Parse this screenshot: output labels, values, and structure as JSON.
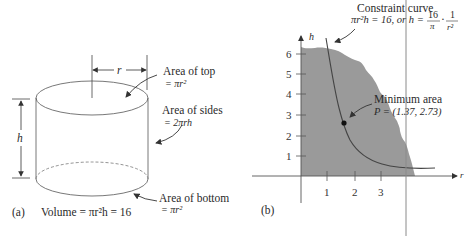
{
  "panel_a": {
    "caption_tag": "(a)",
    "caption_text": "Volume = πr²h = 16",
    "dimension_r": "r",
    "dimension_h": "h",
    "label_top_line1": "Area of top",
    "label_top_line2": "= πr²",
    "label_sides_line1": "Area of sides",
    "label_sides_line2": "= 2πrh",
    "label_bottom_line1": "Area of bottom",
    "label_bottom_line2": "= πr²"
  },
  "panel_b": {
    "caption_tag": "(b)",
    "axis_x_label": "r",
    "axis_y_label": "h",
    "x_ticks": [
      "1",
      "2",
      "3"
    ],
    "y_ticks": [
      "1",
      "2",
      "3",
      "4",
      "5",
      "6"
    ],
    "constraint_line1": "Constraint curve",
    "constraint_line2_a": "πr²h = 16, or h =",
    "constraint_frac1_num": "16",
    "constraint_frac1_den": "π",
    "constraint_dot": "·",
    "constraint_frac2_num": "1",
    "constraint_frac2_den": "r²",
    "min_line1": "Minimum area",
    "min_line2": "P = (1.37, 2.73)",
    "region_color": "#9a9a9a",
    "curve_color": "#444444"
  }
}
